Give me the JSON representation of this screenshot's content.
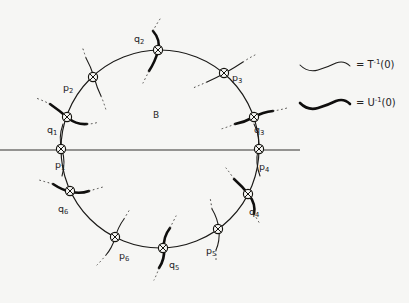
{
  "figure": {
    "region_label": "B",
    "background_color": "#f6f6f4",
    "ink_color": "#1b1a18",
    "circle": {
      "cx": 160,
      "cy": 149,
      "r": 99
    },
    "axis": {
      "y": 150,
      "x_start": 0,
      "x_end": 300
    },
    "nodes": [
      {
        "id": "p1",
        "label": "p",
        "sub": "1",
        "kind": "p",
        "angle_deg": 180,
        "label_dx": -2,
        "label_dy": 18
      },
      {
        "id": "q1",
        "label": "q",
        "sub": "1",
        "kind": "q",
        "angle_deg": 161,
        "label_dx": -16,
        "label_dy": 14
      },
      {
        "id": "p2",
        "label": "p",
        "sub": "2",
        "kind": "p",
        "angle_deg": 133,
        "label_dx": -20,
        "label_dy": 11
      },
      {
        "id": "q2",
        "label": "q",
        "sub": "2",
        "kind": "q",
        "angle_deg": 91,
        "label_dx": -20,
        "label_dy": -6
      },
      {
        "id": "p3",
        "label": "p",
        "sub": "3",
        "kind": "p",
        "angle_deg": 50,
        "label_dx": 8,
        "label_dy": 9
      },
      {
        "id": "q3",
        "label": "q",
        "sub": "3",
        "kind": "q",
        "angle_deg": 19,
        "label_dx": 4,
        "label_dy": 16
      },
      {
        "id": "p4",
        "label": "p",
        "sub": "4",
        "kind": "p",
        "angle_deg": 0,
        "label_dx": 2,
        "label_dy": 18
      },
      {
        "id": "q4",
        "label": "q",
        "sub": "4",
        "kind": "q",
        "angle_deg": -27,
        "label_dx": 7,
        "label_dy": 19
      },
      {
        "id": "p5",
        "label": "p",
        "sub": "5",
        "kind": "p",
        "angle_deg": -54,
        "label_dx": -5,
        "label_dy": 20
      },
      {
        "id": "q5",
        "label": "q",
        "sub": "5",
        "kind": "q",
        "angle_deg": -88,
        "label_dx": -4,
        "label_dy": 20
      },
      {
        "id": "p6",
        "label": "p",
        "sub": "6",
        "kind": "p",
        "angle_deg": -117,
        "label_dx": -3,
        "label_dy": 20
      },
      {
        "id": "q6",
        "label": "q",
        "sub": "6",
        "kind": "q",
        "angle_deg": -155,
        "label_dx": -8,
        "label_dy": 21
      }
    ]
  },
  "legend": {
    "items": [
      {
        "id": "legend-T",
        "stroke": "thin",
        "equals": "=",
        "symbol": "T",
        "exponent": "-1",
        "argument": "(0)",
        "full_text": "= T-1(0)"
      },
      {
        "id": "legend-U",
        "stroke": "thick",
        "equals": "=",
        "symbol": "U",
        "exponent": "-1",
        "argument": "(0)",
        "full_text": "= U-1(0)"
      }
    ]
  }
}
